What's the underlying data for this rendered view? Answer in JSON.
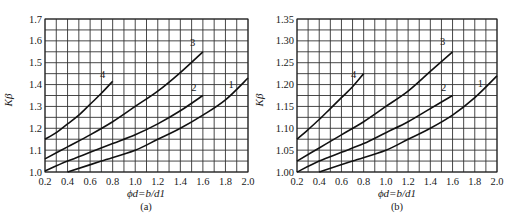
{
  "chart_data": [
    {
      "type": "line",
      "panel_label": "(a)",
      "xlabel": "ϕd=b/d1",
      "ylabel": "Kβ",
      "xlim": [
        0.2,
        2.0
      ],
      "ylim": [
        1.0,
        1.7
      ],
      "x_ticks": [
        0.2,
        0.4,
        0.6,
        0.8,
        1.0,
        1.2,
        1.4,
        1.6,
        1.8,
        2.0
      ],
      "x_tick_labels": [
        "0.2",
        "0.4",
        "0.6",
        "0.8",
        "1.0",
        "1.2",
        "1.4",
        "1.6",
        "1.8",
        "2.0"
      ],
      "y_ticks": [
        1.0,
        1.1,
        1.2,
        1.3,
        1.4,
        1.5,
        1.6,
        1.7
      ],
      "y_tick_labels": [
        "1.0",
        "1.1",
        "1.2",
        "1.3",
        "1.4",
        "1.5",
        "1.6",
        "1.7"
      ],
      "grid": {
        "x_step": 0.1,
        "y_step": 0.05
      },
      "series": [
        {
          "name": "1",
          "x": [
            0.4,
            0.7,
            1.0,
            1.2,
            1.4,
            1.6,
            1.8,
            2.0
          ],
          "values": [
            1.0,
            1.05,
            1.1,
            1.15,
            1.2,
            1.26,
            1.33,
            1.43
          ],
          "label_pos": [
            1.85,
            1.385
          ]
        },
        {
          "name": "2",
          "x": [
            0.2,
            0.4,
            0.6,
            0.8,
            1.0,
            1.2,
            1.4,
            1.6
          ],
          "values": [
            1.005,
            1.05,
            1.09,
            1.13,
            1.17,
            1.22,
            1.28,
            1.35
          ],
          "label_pos": [
            1.52,
            1.37
          ]
        },
        {
          "name": "3",
          "x": [
            0.2,
            0.4,
            0.6,
            0.8,
            1.0,
            1.2,
            1.4,
            1.6
          ],
          "values": [
            1.06,
            1.115,
            1.17,
            1.23,
            1.3,
            1.37,
            1.455,
            1.55
          ],
          "label_pos": [
            1.51,
            1.575
          ]
        },
        {
          "name": "4",
          "x": [
            0.2,
            0.3,
            0.4,
            0.5,
            0.6,
            0.7,
            0.8
          ],
          "values": [
            1.15,
            1.18,
            1.22,
            1.26,
            1.31,
            1.36,
            1.415
          ],
          "label_pos": [
            0.71,
            1.43
          ]
        }
      ]
    },
    {
      "type": "line",
      "panel_label": "(b)",
      "xlabel": "ϕd=b/d1",
      "ylabel": "Kβ",
      "xlim": [
        0.2,
        2.0
      ],
      "ylim": [
        1.0,
        1.35
      ],
      "x_ticks": [
        0.2,
        0.4,
        0.6,
        0.8,
        1.0,
        1.2,
        1.4,
        1.6,
        1.8,
        2.0
      ],
      "x_tick_labels": [
        "0.2",
        "0.4",
        "0.6",
        "0.8",
        "1.0",
        "1.2",
        "1.4",
        "1.6",
        "1.8",
        "2.0"
      ],
      "y_ticks": [
        1.0,
        1.05,
        1.1,
        1.15,
        1.2,
        1.25,
        1.3,
        1.35
      ],
      "y_tick_labels": [
        "1.00",
        "1.05",
        "1.10",
        "1.15",
        "1.20",
        "1.25",
        "1.30",
        "1.35"
      ],
      "grid": {
        "x_step": 0.1,
        "y_step": 0.025
      },
      "series": [
        {
          "name": "1",
          "x": [
            0.4,
            0.7,
            1.0,
            1.2,
            1.4,
            1.6,
            1.8,
            2.0
          ],
          "values": [
            1.0,
            1.025,
            1.05,
            1.075,
            1.1,
            1.13,
            1.17,
            1.22
          ],
          "label_pos": [
            1.85,
            1.195
          ]
        },
        {
          "name": "2",
          "x": [
            0.2,
            0.4,
            0.6,
            0.8,
            1.0,
            1.2,
            1.4,
            1.6
          ],
          "values": [
            1.0,
            1.025,
            1.045,
            1.065,
            1.09,
            1.115,
            1.145,
            1.175
          ],
          "label_pos": [
            1.52,
            1.185
          ]
        },
        {
          "name": "3",
          "x": [
            0.2,
            0.4,
            0.6,
            0.8,
            1.0,
            1.2,
            1.4,
            1.6
          ],
          "values": [
            1.025,
            1.055,
            1.085,
            1.115,
            1.15,
            1.185,
            1.23,
            1.275
          ],
          "label_pos": [
            1.51,
            1.29
          ]
        },
        {
          "name": "4",
          "x": [
            0.2,
            0.3,
            0.4,
            0.5,
            0.6,
            0.7,
            0.8
          ],
          "values": [
            1.075,
            1.097,
            1.12,
            1.145,
            1.17,
            1.195,
            1.225
          ],
          "label_pos": [
            0.71,
            1.215
          ]
        }
      ]
    }
  ]
}
